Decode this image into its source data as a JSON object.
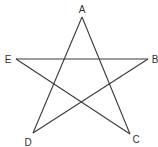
{
  "diagram": {
    "type": "pentagram",
    "stroke_color": "#3a3a3a",
    "vertices": [
      {
        "id": "A",
        "label": "A",
        "x": 82,
        "y": 17,
        "lx": 82,
        "ly": 13
      },
      {
        "id": "B",
        "label": "B",
        "x": 148,
        "y": 59,
        "lx": 155,
        "ly": 63
      },
      {
        "id": "C",
        "label": "C",
        "x": 130,
        "y": 134,
        "lx": 136,
        "ly": 143
      },
      {
        "id": "D",
        "label": "D",
        "x": 33,
        "y": 133,
        "lx": 28,
        "ly": 146
      },
      {
        "id": "E",
        "label": "E",
        "x": 16,
        "y": 59,
        "lx": 8,
        "ly": 63
      }
    ],
    "edges": [
      [
        "A",
        "D"
      ],
      [
        "A",
        "C"
      ],
      [
        "E",
        "B"
      ],
      [
        "E",
        "C"
      ],
      [
        "D",
        "B"
      ]
    ]
  }
}
